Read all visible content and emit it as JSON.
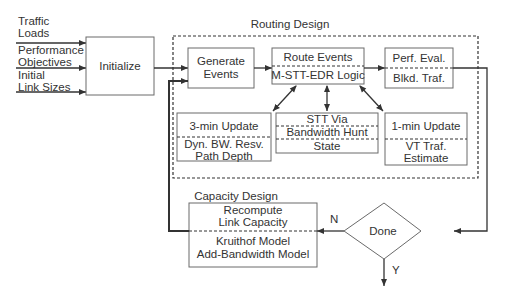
{
  "inputs": {
    "traffic_loads": [
      "Traffic",
      "Loads"
    ],
    "performance_objectives": [
      "Performance",
      "Objectives"
    ],
    "initial_link_sizes": [
      "Initial",
      "Link Sizes"
    ]
  },
  "initialize": {
    "label": "Initialize"
  },
  "routing_design": {
    "title": "Routing Design",
    "generate_events": [
      "Generate",
      "Events"
    ],
    "route_events": {
      "top": "Route Events",
      "bottom": "M-STT-EDR Logic"
    },
    "perf_eval": {
      "top": "Perf. Eval.",
      "bottom": "Blkd. Traf."
    },
    "three_min": {
      "top": "3-min Update",
      "bottom": [
        "Dyn. BW. Resv.",
        "Path Depth"
      ]
    },
    "stt_via": {
      "rows": [
        "STT Via",
        "Bandwidth Hunt",
        "State"
      ]
    },
    "one_min": {
      "top": "1-min Update",
      "bottom": [
        "VT Traf.",
        "Estimate"
      ]
    }
  },
  "capacity_design": {
    "title": "Capacity Design",
    "top": [
      "Recompute",
      "Link Capacity"
    ],
    "bottom": [
      "Kruithof Model",
      "Add-Bandwidth Model"
    ]
  },
  "decision": {
    "label": "Done",
    "no_label": "N",
    "yes_label": "Y"
  },
  "colors": {
    "line": "#333333",
    "box_border": "#6a6a6a",
    "text": "#333333",
    "background": "#ffffff"
  }
}
